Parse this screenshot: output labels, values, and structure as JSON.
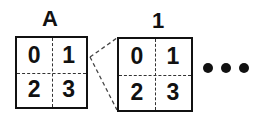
{
  "diagram": {
    "blocks": [
      {
        "label": "A",
        "cells": [
          "0",
          "1",
          "2",
          "3"
        ]
      },
      {
        "label": "1",
        "cells": [
          "0",
          "1",
          "2",
          "3"
        ]
      }
    ],
    "continuation": "•••",
    "connector": "dashed lines from cell 1 of block A to block 1"
  }
}
